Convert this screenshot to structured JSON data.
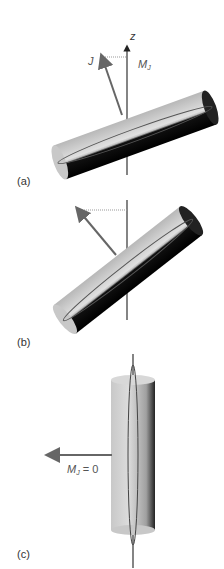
{
  "figure": {
    "panels": [
      {
        "id": "a",
        "label": "(a)",
        "axis_label": "z",
        "vector_label": "J",
        "projection_label": "M",
        "projection_subscript": "J"
      },
      {
        "id": "b",
        "label": "(b)"
      },
      {
        "id": "c",
        "label": "(c)",
        "projection_label": "M",
        "projection_subscript": "J",
        "projection_value": "= 0"
      }
    ],
    "colors": {
      "axis": "#333333",
      "vector": "#666666",
      "cylinder_light": "#c8c8c8",
      "cylinder_dark": "#000000",
      "dotted": "#999999"
    }
  }
}
